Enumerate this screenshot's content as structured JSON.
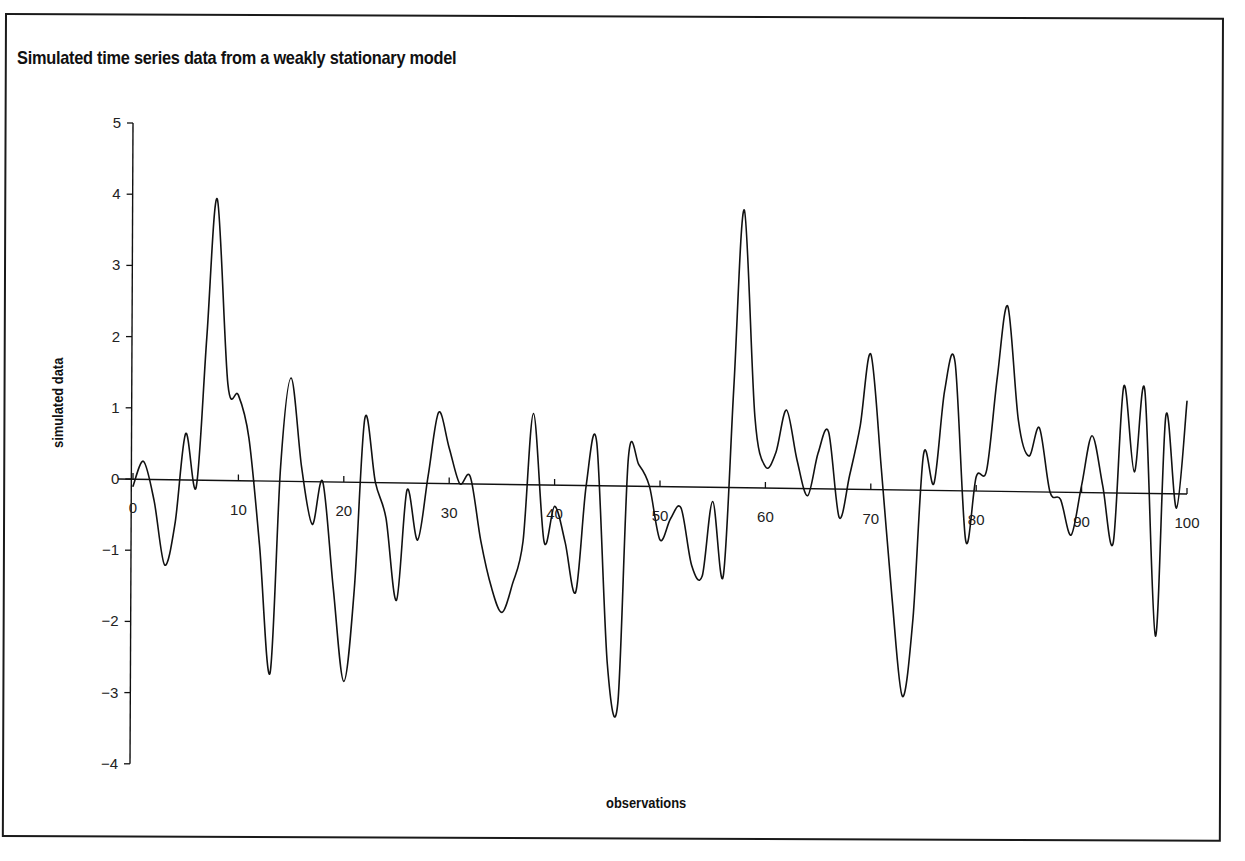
{
  "chart_data": {
    "type": "line",
    "title": "Simulated time series data from a weakly stationary model",
    "xlabel": "observations",
    "ylabel": "simulated data",
    "xlim": [
      0,
      100
    ],
    "ylim": [
      -4,
      5
    ],
    "grid": false,
    "legend": null,
    "x_ticks": [
      0,
      10,
      20,
      30,
      40,
      50,
      60,
      70,
      80,
      90,
      100
    ],
    "y_ticks": [
      5,
      4,
      3,
      2,
      1,
      0,
      -1,
      -2,
      -3,
      -4
    ],
    "y_tick_labels": [
      "5",
      "4",
      "3",
      "2",
      "1",
      "0",
      "−1",
      "−2",
      "−3",
      "−4"
    ],
    "x_tick_labels": [
      "0",
      "10",
      "20",
      "30",
      "40",
      "50",
      "60",
      "70",
      "80",
      "90",
      "100"
    ],
    "series": [
      {
        "name": "simulated data",
        "color": "#111111",
        "x": [
          0,
          1,
          2,
          3,
          4,
          5,
          6,
          7,
          8,
          9,
          10,
          11,
          12,
          13,
          14,
          15,
          16,
          17,
          18,
          19,
          20,
          21,
          22,
          23,
          24,
          25,
          26,
          27,
          28,
          29,
          30,
          31,
          32,
          33,
          34,
          35,
          36,
          37,
          38,
          39,
          40,
          41,
          42,
          43,
          44,
          45,
          46,
          47,
          48,
          49,
          50,
          51,
          52,
          53,
          54,
          55,
          56,
          57,
          58,
          59,
          60,
          61,
          62,
          63,
          64,
          65,
          66,
          67,
          68,
          69,
          70,
          71,
          72,
          73,
          74,
          75,
          76,
          77,
          78,
          79,
          80,
          81,
          82,
          83,
          84,
          85,
          86,
          87,
          88,
          89,
          90,
          91,
          92,
          93,
          94,
          95,
          96,
          97,
          98,
          99,
          100
        ],
        "values": [
          -0.1,
          0.25,
          -0.3,
          -1.2,
          -0.6,
          0.65,
          -0.1,
          2.0,
          3.95,
          1.35,
          1.2,
          0.6,
          -0.9,
          -2.7,
          0.2,
          1.45,
          0.2,
          -0.6,
          0.0,
          -1.5,
          -2.8,
          -1.5,
          0.9,
          0.0,
          -0.5,
          -1.65,
          -0.1,
          -0.8,
          0.1,
          1.0,
          0.5,
          0.0,
          0.1,
          -0.8,
          -1.45,
          -1.8,
          -1.4,
          -0.8,
          1.0,
          -0.8,
          -0.3,
          -0.8,
          -1.5,
          0.0,
          0.6,
          -2.5,
          -3.05,
          0.4,
          0.3,
          0.0,
          -0.75,
          -0.45,
          -0.3,
          -1.1,
          -1.25,
          -0.2,
          -1.25,
          1.4,
          3.9,
          1.0,
          0.3,
          0.5,
          1.1,
          0.4,
          -0.1,
          0.5,
          0.8,
          -0.4,
          0.2,
          0.9,
          1.9,
          0.3,
          -1.5,
          -2.9,
          -1.8,
          0.5,
          0.1,
          1.4,
          1.8,
          -0.7,
          0.2,
          0.3,
          1.6,
          2.6,
          1.0,
          0.5,
          0.9,
          0.0,
          -0.1,
          -0.6,
          0.1,
          0.8,
          0.1,
          -0.7,
          1.5,
          0.3,
          1.45,
          -2.0,
          1.1,
          -0.2,
          1.3
        ]
      }
    ]
  },
  "axes": {
    "x_axis_line": "horizontal axis at y = 0",
    "y_axis_line": "vertical axis at x = 0"
  }
}
